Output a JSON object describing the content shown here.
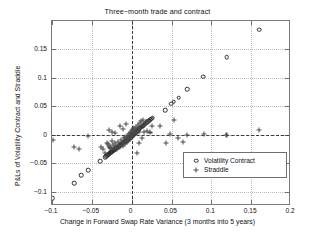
{
  "chart_data": {
    "type": "scatter",
    "title": "Three−month trade and contract",
    "xlabel": "Change in Forward Swap Rate Variance (3 months into 5 years)",
    "ylabel": "P&Ls of Volatility Contract and Straddle",
    "xlim": [
      -0.1,
      0.2
    ],
    "ylim": [
      -0.125,
      0.2
    ],
    "xticks": [
      -0.1,
      -0.05,
      0,
      0.05,
      0.1,
      0.15,
      0.2
    ],
    "xticklabels": [
      "−0.1",
      "−0.05",
      "0",
      "0.05",
      "0.1",
      "0.15",
      "0.2"
    ],
    "yticks": [
      -0.1,
      -0.05,
      0,
      0.05,
      0.1,
      0.15
    ],
    "yticklabels": [
      "−0.1",
      "−0.05",
      "0",
      "0.05",
      "0.1",
      "0.15"
    ],
    "grid": true,
    "reference_lines": [
      {
        "axis": "x",
        "value": 0,
        "style": "dashed"
      },
      {
        "axis": "y",
        "value": 0,
        "style": "dashed"
      }
    ],
    "legend": {
      "position": "lower-right",
      "entries": [
        {
          "label": "Volatility Contract",
          "marker": "circle"
        },
        {
          "label": "Straddle",
          "marker": "plus"
        }
      ]
    },
    "series": [
      {
        "name": "Volatility Contract",
        "marker": "circle",
        "points": [
          [
            -0.099,
            -0.111
          ],
          [
            -0.072,
            -0.0852
          ],
          [
            -0.0632,
            -0.071
          ],
          [
            -0.0548,
            -0.0622
          ],
          [
            -0.0398,
            -0.0468
          ],
          [
            -0.033,
            -0.0392
          ],
          [
            -0.0318,
            -0.0375
          ],
          [
            -0.0305,
            -0.036
          ],
          [
            -0.0296,
            -0.0348
          ],
          [
            -0.0288,
            -0.0338
          ],
          [
            -0.0278,
            -0.0325
          ],
          [
            -0.0268,
            -0.0316
          ],
          [
            -0.0258,
            -0.0305
          ],
          [
            -0.025,
            -0.0296
          ],
          [
            -0.0242,
            -0.0286
          ],
          [
            -0.0233,
            -0.0277
          ],
          [
            -0.0225,
            -0.0268
          ],
          [
            -0.0217,
            -0.0258
          ],
          [
            -0.0209,
            -0.025
          ],
          [
            -0.02,
            -0.024
          ],
          [
            -0.0192,
            -0.0232
          ],
          [
            -0.0184,
            -0.0223
          ],
          [
            -0.0176,
            -0.0214
          ],
          [
            -0.0168,
            -0.0206
          ],
          [
            -0.016,
            -0.0198
          ],
          [
            -0.0152,
            -0.0189
          ],
          [
            -0.0144,
            -0.0181
          ],
          [
            -0.0136,
            -0.0172
          ],
          [
            -0.0128,
            -0.0164
          ],
          [
            -0.012,
            -0.0156
          ],
          [
            -0.0112,
            -0.0148
          ],
          [
            -0.0104,
            -0.014
          ],
          [
            -0.0096,
            -0.0132
          ],
          [
            -0.0088,
            -0.0124
          ],
          [
            -0.008,
            -0.0116
          ],
          [
            -0.0072,
            -0.0108
          ],
          [
            -0.0064,
            -0.01
          ],
          [
            -0.0056,
            -0.0092
          ],
          [
            -0.0048,
            -0.0084
          ],
          [
            -0.004,
            -0.0076
          ],
          [
            -0.0032,
            -0.0066
          ],
          [
            -0.0026,
            -0.0058
          ],
          [
            -0.002,
            -0.005
          ],
          [
            -0.0014,
            -0.0042
          ],
          [
            -0.0008,
            -0.0034
          ],
          [
            -0.0002,
            -0.0026
          ],
          [
            0.0004,
            -0.0018
          ],
          [
            0.001,
            -0.001
          ],
          [
            0.0016,
            -0.0002
          ],
          [
            0.0022,
            0.0006
          ],
          [
            0.0028,
            0.0014
          ],
          [
            0.0034,
            0.0022
          ],
          [
            0.004,
            0.003
          ],
          [
            0.0048,
            0.004
          ],
          [
            0.0056,
            0.005
          ],
          [
            0.0064,
            0.0062
          ],
          [
            0.0072,
            0.0074
          ],
          [
            0.008,
            0.0086
          ],
          [
            0.009,
            0.01
          ],
          [
            0.01,
            0.0112
          ],
          [
            0.0112,
            0.0126
          ],
          [
            0.0124,
            0.014
          ],
          [
            0.0136,
            0.0154
          ],
          [
            0.015,
            0.017
          ],
          [
            0.0164,
            0.0186
          ],
          [
            0.0178,
            0.0202
          ],
          [
            0.0192,
            0.0218
          ],
          [
            0.0206,
            0.0236
          ],
          [
            0.022,
            0.0252
          ],
          [
            0.0234,
            0.0268
          ],
          [
            0.0248,
            0.0286
          ],
          [
            0.0262,
            0.0304
          ],
          [
            0.0418,
            0.043
          ],
          [
            0.0498,
            0.0548
          ],
          [
            0.053,
            0.058
          ],
          [
            0.0592,
            0.065
          ],
          [
            0.07,
            0.08
          ],
          [
            0.0896,
            0.1018
          ],
          [
            0.1192,
            0.1365
          ],
          [
            0.16,
            0.1845
          ]
        ]
      },
      {
        "name": "Straddle",
        "marker": "plus",
        "points": [
          [
            -0.0988,
            -0.0092
          ],
          [
            -0.0725,
            -0.0218
          ],
          [
            -0.0665,
            -0.0245
          ],
          [
            -0.0548,
            -0.0015
          ],
          [
            -0.0382,
            -0.021
          ],
          [
            -0.0358,
            -0.025
          ],
          [
            -0.033,
            -0.0318
          ],
          [
            -0.0312,
            -0.0136
          ],
          [
            -0.03,
            -0.0165
          ],
          [
            -0.0286,
            -0.0198
          ],
          [
            -0.0272,
            -0.0222
          ],
          [
            -0.0258,
            -0.025
          ],
          [
            -0.0244,
            -0.0108
          ],
          [
            -0.023,
            -0.0178
          ],
          [
            -0.0218,
            -0.0226
          ],
          [
            -0.0205,
            -0.0148
          ],
          [
            -0.0192,
            -0.0195
          ],
          [
            -0.018,
            -0.0252
          ],
          [
            -0.0168,
            -0.012
          ],
          [
            -0.0156,
            -0.017
          ],
          [
            -0.0144,
            -0.0215
          ],
          [
            -0.0132,
            -0.009
          ],
          [
            -0.0122,
            -0.014
          ],
          [
            -0.0112,
            -0.0188
          ],
          [
            -0.0102,
            -0.006
          ],
          [
            -0.0094,
            -0.0112
          ],
          [
            -0.0086,
            -0.0158
          ],
          [
            -0.0078,
            -0.0035
          ],
          [
            -0.007,
            -0.0085
          ],
          [
            -0.0062,
            -0.013
          ],
          [
            -0.0056,
            -0.0012
          ],
          [
            -0.005,
            -0.006
          ],
          [
            -0.0044,
            -0.0105
          ],
          [
            -0.0038,
            0.0012
          ],
          [
            -0.0032,
            -0.0035
          ],
          [
            -0.0026,
            -0.008
          ],
          [
            -0.002,
            0.0035
          ],
          [
            -0.0016,
            -0.0012
          ],
          [
            -0.0012,
            -0.0055
          ],
          [
            -0.0008,
            0.0058
          ],
          [
            -0.0004,
            0.0008
          ],
          [
            0.0,
            -0.0032
          ],
          [
            0.0004,
            0.008
          ],
          [
            0.0008,
            0.003
          ],
          [
            0.0012,
            -0.001
          ],
          [
            0.0016,
            0.0102
          ],
          [
            0.0022,
            0.0052
          ],
          [
            0.0026,
            0.0012
          ],
          [
            0.0032,
            0.0124
          ],
          [
            0.0038,
            0.0072
          ],
          [
            0.0044,
            0.0028
          ],
          [
            0.0052,
            0.0146
          ],
          [
            0.0058,
            0.0092
          ],
          [
            0.0066,
            0.0044
          ],
          [
            0.0076,
            0.0168
          ],
          [
            0.0086,
            0.0112
          ],
          [
            0.0096,
            0.0058
          ],
          [
            -0.029,
            0.0085
          ],
          [
            -0.0252,
            0.0055
          ],
          [
            -0.0205,
            0.0032
          ],
          [
            -0.015,
            0.0148
          ],
          [
            -0.0105,
            0.0108
          ],
          [
            -0.0068,
            0.0185
          ],
          [
            0.0102,
            0.0215
          ],
          [
            0.0122,
            0.0245
          ],
          [
            0.014,
            0.0268
          ],
          [
            0.0066,
            -0.0318
          ],
          [
            0.009,
            -0.0145
          ],
          [
            0.0132,
            -0.006
          ],
          [
            0.0155,
            0.0056
          ],
          [
            0.018,
            0.0228
          ],
          [
            0.0198,
            0.007
          ],
          [
            0.0225,
            0.0042
          ],
          [
            0.0258,
            0.015
          ],
          [
            0.036,
            0.0148
          ],
          [
            0.043,
            -0.0135
          ],
          [
            0.0475,
            0.0018
          ],
          [
            0.0528,
            0.0262
          ],
          [
            0.0578,
            -0.006
          ],
          [
            0.064,
            -0.0125
          ],
          [
            0.07,
            0.0
          ],
          [
            0.0905,
            0.0008
          ],
          [
            0.119,
            0.0002
          ],
          [
            0.16,
            0.0088
          ]
        ]
      }
    ]
  }
}
